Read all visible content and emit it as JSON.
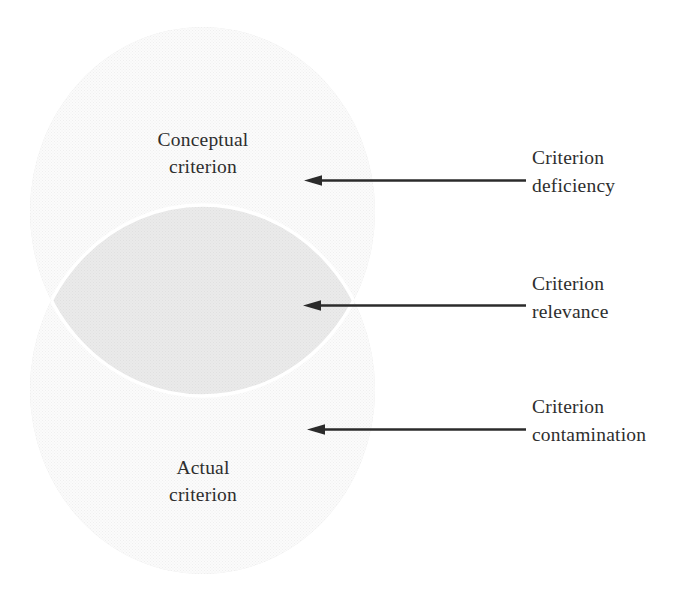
{
  "figure": {
    "type": "venn-diagram",
    "sets": [
      {
        "id": "conceptual",
        "label": "Conceptual\ncriterion"
      },
      {
        "id": "actual",
        "label": "Actual\ncriterion"
      }
    ],
    "callouts": [
      {
        "id": "deficiency",
        "label": "Criterion\ndeficiency",
        "target": "conceptual-only-region"
      },
      {
        "id": "relevance",
        "label": "Criterion\nrelevance",
        "target": "overlap-region"
      },
      {
        "id": "contamination",
        "label": "Criterion\ncontamination",
        "target": "actual-only-region"
      }
    ],
    "colors": {
      "set_fill": "#e2e2e2",
      "overlap_fill": "#b9b9b9",
      "overlap_outline": "#ffffff",
      "arrow": "#2b2b2b",
      "text": "#2e2e2e",
      "background": "#ffffff"
    },
    "geometry": {
      "circle_width": 345,
      "circle_height": 369,
      "conceptual_top": 27,
      "actual_top": 205,
      "circles_left": 30
    }
  }
}
